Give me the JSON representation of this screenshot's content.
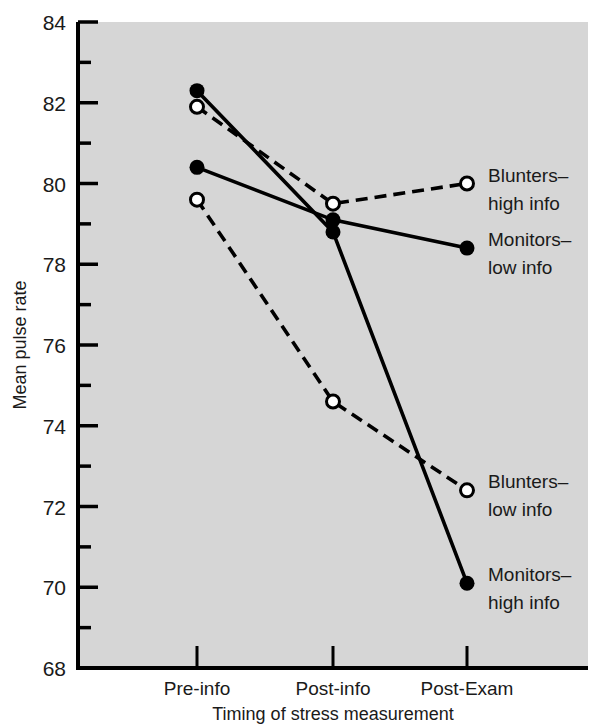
{
  "chart_data": {
    "type": "line",
    "title": "",
    "xlabel": "Timing of stress measurement",
    "ylabel": "Mean pulse rate",
    "categories": [
      "Pre-info",
      "Post-info",
      "Post-Exam"
    ],
    "ylim": [
      68,
      84
    ],
    "y_ticks_major": [
      68,
      70,
      72,
      74,
      76,
      78,
      80,
      82,
      84
    ],
    "y_ticks_minor": [
      69,
      71,
      73,
      75,
      77,
      79,
      81,
      83
    ],
    "y_tick_labels": [
      "68",
      "70",
      "72",
      "74",
      "76",
      "78",
      "80",
      "82",
      "84"
    ],
    "grid": false,
    "legend_position": "right-inline-labels",
    "plot_background": "#d6d6d6",
    "line_color": "#000000",
    "series": [
      {
        "name": "Monitors–high info",
        "label_line1": "Monitors–",
        "label_line2": "high info",
        "marker": "filled-circle",
        "line_style": "solid",
        "values": [
          82.3,
          78.8,
          70.1
        ]
      },
      {
        "name": "Blunters–high info",
        "label_line1": "Blunters–",
        "label_line2": "high info",
        "marker": "open-circle",
        "line_style": "dashed",
        "values": [
          81.9,
          79.5,
          80.0
        ]
      },
      {
        "name": "Monitors–low info",
        "label_line1": "Monitors–",
        "label_line2": "low info",
        "marker": "filled-circle",
        "line_style": "solid",
        "values": [
          80.4,
          79.1,
          78.4
        ]
      },
      {
        "name": "Blunters–low info",
        "label_line1": "Blunters–",
        "label_line2": "low info",
        "marker": "open-circle",
        "line_style": "dashed",
        "values": [
          79.6,
          74.6,
          72.4
        ]
      }
    ]
  }
}
